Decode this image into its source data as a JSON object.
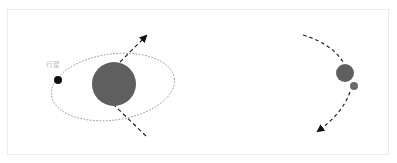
{
  "diagram": {
    "left_panel": {
      "planet_label": "行星",
      "star": {
        "cx": 114,
        "cy": 84,
        "r": 22,
        "color": "#5f5f5f"
      },
      "planet": {
        "cx": 58,
        "cy": 80,
        "r": 4,
        "color": "#111111"
      },
      "orbit": {
        "cx": 113,
        "cy": 87,
        "rx": 62,
        "ry": 33,
        "rotate": -8,
        "color": "#888888"
      },
      "trajectory": {
        "color": "#222222"
      }
    },
    "right_panel": {
      "large_body": {
        "cx": 345,
        "cy": 73,
        "r": 9,
        "color": "#5f5f5f"
      },
      "small_body": {
        "cx": 354,
        "cy": 86,
        "r": 4,
        "color": "#6a6a6a"
      },
      "trajectory": {
        "color": "#222222"
      }
    },
    "colors": {
      "frame_border": "#ececec",
      "label": "#c4c4c4"
    }
  }
}
